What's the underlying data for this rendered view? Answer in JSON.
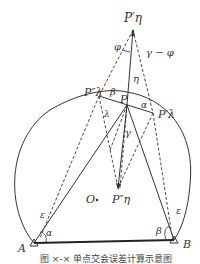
{
  "figure": {
    "caption": "图 ×-× 单点交会误差计算示意图",
    "points": {
      "P_eta_prime": "P′η",
      "P": "P",
      "P_lambda_double_prime": "P″λ",
      "P_lambda_prime": "P′λ",
      "P_eta_double_prime": "P″η",
      "O": "O",
      "A": "A",
      "B": "B"
    },
    "angles": {
      "phi": "φ",
      "gamma_minus_phi": "γ − φ",
      "eta": "η",
      "beta_top": "β",
      "alpha_top": "α",
      "lambda": "λ",
      "gamma": "γ",
      "epsilon_left": "ε",
      "epsilon_right": "ε",
      "alpha_A": "α",
      "beta_B": "β"
    },
    "colors": {
      "line": "#333333",
      "background": "#ffffff"
    }
  }
}
